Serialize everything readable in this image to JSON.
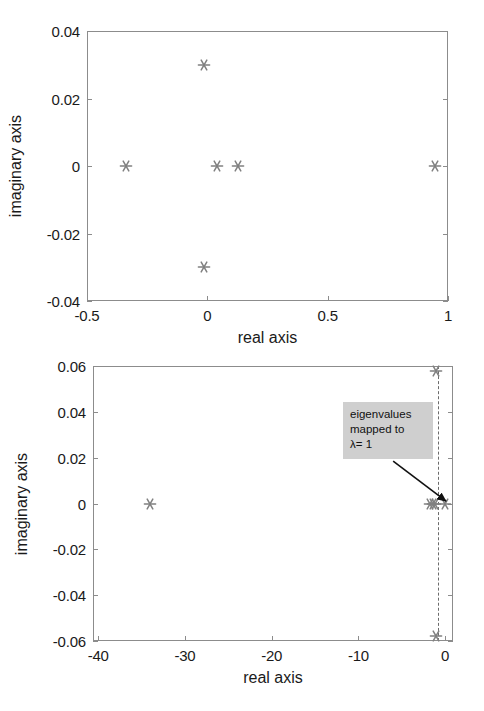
{
  "figure": {
    "background": "#ffffff",
    "marker_color": "#808080",
    "axis_color": "#8c8c8c",
    "annotation_bg": "#cfcfcf"
  },
  "chart_data": [
    {
      "type": "scatter",
      "title": "",
      "panel": "top",
      "xlabel": "real axis",
      "ylabel": "imaginary axis",
      "xlim": [
        -0.5,
        1.0
      ],
      "ylim": [
        -0.04,
        0.04
      ],
      "xticks": [
        -0.5,
        0,
        0.5,
        1
      ],
      "xticklabels": [
        "-0.5",
        "0",
        "0.5",
        "1"
      ],
      "yticks": [
        -0.04,
        -0.02,
        0,
        0.02,
        0.04
      ],
      "yticklabels": [
        "-0.04",
        "-0.02",
        "0",
        "0.02",
        "0.04"
      ],
      "grid": false,
      "legend": null,
      "marker": "asterisk",
      "series": [
        {
          "name": "eigenvalues",
          "points": [
            {
              "x": -0.338,
              "y": 0.0
            },
            {
              "x": -0.014,
              "y": 0.03
            },
            {
              "x": -0.014,
              "y": -0.03
            },
            {
              "x": 0.04,
              "y": 0.0
            },
            {
              "x": 0.127,
              "y": 0.0
            },
            {
              "x": 0.945,
              "y": 0.0
            }
          ]
        }
      ]
    },
    {
      "type": "scatter",
      "title": "",
      "panel": "bottom",
      "xlabel": "real axis",
      "ylabel": "imaginary axis",
      "xlim": [
        -40.6,
        0.9
      ],
      "ylim": [
        -0.06,
        0.06
      ],
      "xticks": [
        -40,
        -30,
        -20,
        -10,
        0
      ],
      "xticklabels": [
        "-40",
        "-30",
        "-20",
        "-10",
        "0"
      ],
      "yticks": [
        -0.06,
        -0.04,
        -0.02,
        0,
        0.02,
        0.04,
        0.06
      ],
      "yticklabels": [
        "-0.06",
        "-0.04",
        "-0.02",
        "0",
        "0.02",
        "0.04",
        "0.06"
      ],
      "grid": false,
      "legend": null,
      "marker": "asterisk",
      "reference_line": {
        "type": "vertical-dashed",
        "x": -0.8
      },
      "series": [
        {
          "name": "eigenvalues",
          "points": [
            {
              "x": -34.0,
              "y": 0.0
            },
            {
              "x": -1.1,
              "y": 0.058
            },
            {
              "x": -1.1,
              "y": -0.058
            },
            {
              "x": -1.75,
              "y": 0.0
            },
            {
              "x": -1.45,
              "y": 0.0
            },
            {
              "x": -1.15,
              "y": 0.0
            },
            {
              "x": 0.0,
              "y": 0.0
            }
          ]
        }
      ],
      "annotation": {
        "lines": [
          "eigenvalues",
          "mapped to",
          "λ= 1"
        ],
        "arrow_from": {
          "x": -6.0,
          "y": 0.0185
        },
        "arrow_to": {
          "x": 0.1,
          "y": 0.001
        }
      }
    }
  ]
}
